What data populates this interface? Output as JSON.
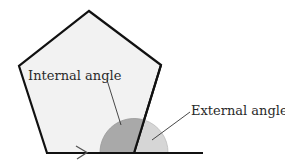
{
  "diagram": {
    "labels": {
      "internal": "Internal angle",
      "external": "External angle"
    },
    "colors": {
      "pentagon_fill": "#f2f2f2",
      "outline": "#111111",
      "internal_angle": "#a9a9a9",
      "external_angle": "#d6d6d6"
    }
  }
}
